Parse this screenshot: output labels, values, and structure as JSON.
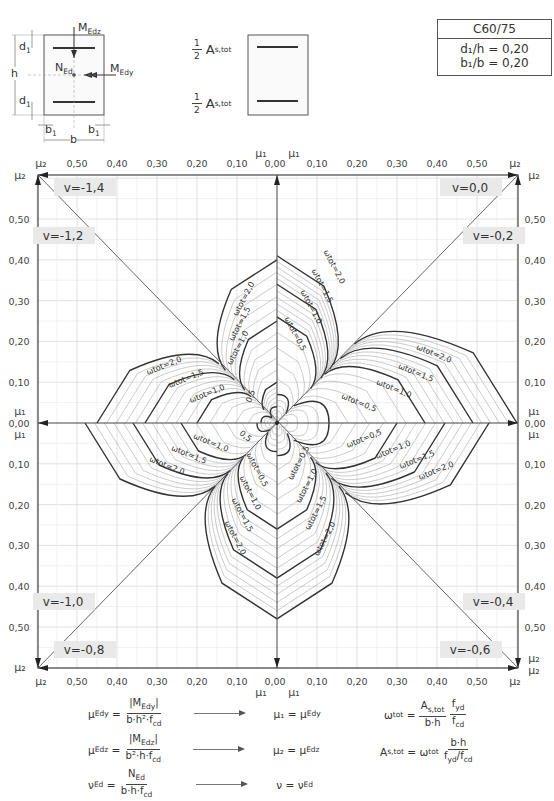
{
  "section": {
    "labels": {
      "MEdz": "M",
      "MEdz_sub": "Edz",
      "MEdy": "M",
      "MEdy_sub": "Edy",
      "NEd": "N",
      "NEd_sub": "Ed",
      "d1": "d",
      "d1_sub": "1",
      "h": "h",
      "b": "b",
      "b1": "b",
      "b1_sub": "1"
    }
  },
  "reinforcement": {
    "half": "1",
    "half_den": "2",
    "As": "A",
    "As_sub": "s,tot"
  },
  "params": {
    "concrete": "C60/75",
    "d1_h": "d₁/h = 0,20",
    "b1_b": "b₁/b = 0,20"
  },
  "formulas": {
    "mu_edy": {
      "lhs": "μ",
      "lhs_sub": "Edy",
      "num": "|M",
      "num_sub": "Edy",
      "num_end": "|",
      "den": "b·h²·f",
      "den_sub": "cd",
      "result": "μ₁ = μ",
      "result_sub": "Edy"
    },
    "mu_edz": {
      "lhs": "μ",
      "lhs_sub": "Edz",
      "num": "|M",
      "num_sub": "Edz",
      "num_end": "|",
      "den": "b²·h·f",
      "den_sub": "cd",
      "result": "μ₂ = μ",
      "result_sub": "Edz"
    },
    "nu_ed": {
      "lhs": "ν",
      "lhs_sub": "Ed",
      "num": "N",
      "num_sub": "Ed",
      "den": "b·h·f",
      "den_sub": "cd",
      "result": "ν = ν",
      "result_sub": "Ed"
    },
    "omega": {
      "lhs": "ω",
      "lhs_sub": "tot",
      "eq": "=",
      "num1": "A",
      "num1_sub": "s,tot",
      "den1": "b·h",
      "num2": "f",
      "num2_sub": "yd",
      "den2": "f",
      "den2_sub": "cd"
    },
    "as_tot": {
      "lhs": "A",
      "lhs_sub": "s,tot",
      "eq": "= ω",
      "eq_sub": "tot",
      "num": "b·h",
      "den": "f",
      "den_sub": "yd",
      "den_mid": "/f",
      "den_sub2": "cd"
    }
  },
  "chart_data": {
    "type": "line",
    "xlabel": "μ₁ (centre) / μ₂ (corners)",
    "ylabel": "μ₂ (corners) / μ₁ (centre)",
    "axis_ranges": {
      "mu_horizontal": [
        0.0,
        0.6
      ],
      "mu_vertical": [
        0.0,
        0.6
      ]
    },
    "grid": true,
    "ticks": [
      "0,00",
      "0,10",
      "0,20",
      "0,30",
      "0,40",
      "0,50"
    ],
    "tick_values": [
      0.0,
      0.1,
      0.2,
      0.3,
      0.4,
      0.5
    ],
    "axis_symbols": {
      "center_top": "μ₁",
      "center_bottom": "μ₁",
      "corner": "μ₂",
      "side_center": "μ₁"
    },
    "octants": [
      {
        "nu": "ν = 0,0",
        "position": "top-right-upper"
      },
      {
        "nu": "ν = -0,2",
        "position": "top-right-lower"
      },
      {
        "nu": "ν = -0,4",
        "position": "bottom-right-lower"
      },
      {
        "nu": "ν = -0,6",
        "position": "bottom-right-upper"
      },
      {
        "nu": "ν = -0,8",
        "position": "bottom-left-upper"
      },
      {
        "nu": "ν = -1,0",
        "position": "bottom-left-lower"
      },
      {
        "nu": "ν = -1,2",
        "position": "top-left-lower"
      },
      {
        "nu": "ν = -1,4",
        "position": "top-left-upper"
      }
    ],
    "omega_levels": [
      0.1,
      0.2,
      0.3,
      0.4,
      0.5,
      0.6,
      0.7,
      0.8,
      0.9,
      1.0,
      1.1,
      1.2,
      1.3,
      1.4,
      1.5,
      1.6,
      1.7,
      1.8,
      1.9,
      2.0
    ],
    "labeled_levels": [
      "ωtot = 0,5",
      "ωtot = 1,0",
      "ωtot = 1,5",
      "ωtot = 2,0"
    ],
    "series": [
      {
        "name": "ν=0,0 (top, right of axis)",
        "mu_axis_intercept": {
          "0.5": 0.07,
          "1.0": 0.26,
          "1.5": 0.34,
          "2.0": 0.41
        }
      },
      {
        "name": "ν=-0,2 (right, above axis)",
        "mu_axis_intercept": {
          "0.5": 0.13,
          "1.0": 0.37,
          "1.5": 0.49,
          "2.0": 0.6
        }
      },
      {
        "name": "ν=-0,4 (right, below axis)",
        "mu_axis_intercept": {
          "0.5": 0.13,
          "1.0": 0.3,
          "1.5": 0.42,
          "2.0": 0.53
        }
      },
      {
        "name": "ν=-0,6 (bottom, right of axis)",
        "mu_axis_intercept": {
          "0.5": 0.08,
          "1.0": 0.26,
          "1.5": 0.38,
          "2.0": 0.48
        }
      },
      {
        "name": "ν=-0,8 (bottom, left of axis)",
        "mu_axis_intercept": {
          "0.5": 0.07,
          "1.0": 0.26,
          "1.5": 0.38,
          "2.0": 0.48
        }
      },
      {
        "name": "ν=-1,0 (left, below axis)",
        "mu_axis_intercept": {
          "0.5": 0.05,
          "1.0": 0.24,
          "1.5": 0.36,
          "2.0": 0.48
        }
      },
      {
        "name": "ν=-1,2 (left, above axis)",
        "mu_axis_intercept": {
          "0.5": 0.04,
          "1.0": 0.2,
          "1.5": 0.33,
          "2.0": 0.45
        }
      },
      {
        "name": "ν=-1,4 (top, left of axis)",
        "mu_axis_intercept": {
          "0.5": 0.04,
          "1.0": 0.1,
          "1.5": 0.25,
          "2.0": 0.4
        }
      }
    ]
  }
}
